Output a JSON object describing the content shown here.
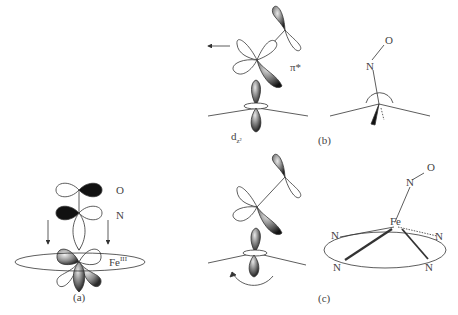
{
  "panels": {
    "a": {
      "caption": "(a)",
      "labels": {
        "oxygen": "O",
        "nitrogen": "N",
        "iron": "Fe",
        "iron_oxidation": "III"
      }
    },
    "b": {
      "caption": "(b)",
      "labels": {
        "pi_star": "π*",
        "dz2_base": "d",
        "dz2_sub": "z²",
        "oxygen": "O",
        "nitrogen": "N"
      }
    },
    "c": {
      "caption": "(c)",
      "labels": {
        "oxygen": "O",
        "nitrogen_top": "N",
        "iron": "Fe",
        "n1": "N",
        "n2": "N",
        "n3": "N",
        "n4": "N"
      }
    }
  },
  "colors": {
    "line": "#333333",
    "dark_lobe": "#111111",
    "shaded_lobe": "#888888",
    "background": "#ffffff"
  }
}
